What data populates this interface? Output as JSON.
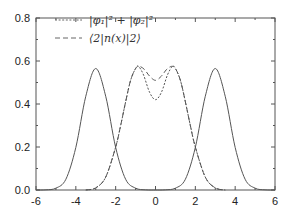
{
  "chart_data": {
    "type": "line",
    "title": "",
    "xlabel": "",
    "ylabel": "",
    "xlim": [
      -6,
      6
    ],
    "ylim": [
      0.0,
      0.8
    ],
    "grid": false,
    "legend_position": "upper-left",
    "x_ticks": [
      "-6",
      "-4",
      "-2",
      "0",
      "2",
      "4",
      "6"
    ],
    "y_ticks": [
      "0.0",
      "0.2",
      "0.4",
      "0.6",
      "0.8"
    ],
    "legend": [
      {
        "label": "|φ₁|² + |φ₂|²",
        "style": "dotted"
      },
      {
        "label": "⟨2|n(x)|2⟩",
        "style": "dashed"
      }
    ],
    "series": [
      {
        "name": "left-localized density",
        "style": "solid",
        "x": [
          -6,
          -5.5,
          -5,
          -4.5,
          -4,
          -3.5,
          -3,
          -2.5,
          -2,
          -1.5,
          -1,
          -0.5,
          0
        ],
        "y": [
          0.0,
          0.0008,
          0.0085,
          0.05,
          0.198,
          0.436,
          0.565,
          0.436,
          0.198,
          0.05,
          0.0085,
          0.0008,
          0.0
        ]
      },
      {
        "name": "right-localized density",
        "style": "solid",
        "x": [
          0,
          0.5,
          1,
          1.5,
          2,
          2.5,
          3,
          3.5,
          4,
          4.5,
          5,
          5.5,
          6
        ],
        "y": [
          0.0,
          0.0008,
          0.0085,
          0.05,
          0.198,
          0.436,
          0.565,
          0.436,
          0.198,
          0.05,
          0.0085,
          0.0008,
          0.0
        ]
      },
      {
        "name": "|φ₁|² + |φ₂|²",
        "style": "dotted",
        "x": [
          -3.5,
          -3,
          -2.5,
          -2,
          -1.75,
          -1.5,
          -1.25,
          -1,
          -0.85,
          -0.6,
          -0.3,
          0,
          0.3,
          0.6,
          0.85,
          1,
          1.25,
          1.5,
          1.75,
          2,
          2.5,
          3,
          3.5
        ],
        "y": [
          0.0,
          0.01,
          0.06,
          0.2,
          0.3,
          0.41,
          0.51,
          0.565,
          0.575,
          0.535,
          0.455,
          0.42,
          0.455,
          0.535,
          0.575,
          0.565,
          0.51,
          0.41,
          0.3,
          0.2,
          0.06,
          0.01,
          0.0
        ]
      },
      {
        "name": "⟨2|n(x)|2⟩",
        "style": "dashed",
        "x": [
          -3.5,
          -3,
          -2.5,
          -2,
          -1.75,
          -1.5,
          -1.25,
          -1,
          -0.8,
          -0.55,
          -0.3,
          0,
          0.3,
          0.55,
          0.8,
          1,
          1.25,
          1.5,
          1.75,
          2,
          2.5,
          3,
          3.5
        ],
        "y": [
          0.0,
          0.01,
          0.06,
          0.2,
          0.3,
          0.41,
          0.51,
          0.565,
          0.575,
          0.56,
          0.53,
          0.51,
          0.53,
          0.56,
          0.575,
          0.565,
          0.51,
          0.41,
          0.3,
          0.2,
          0.06,
          0.01,
          0.0
        ]
      }
    ]
  }
}
